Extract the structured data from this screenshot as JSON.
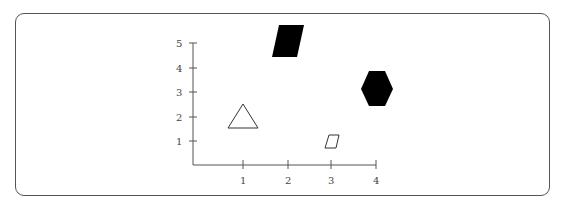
{
  "diagram": {
    "type": "coordinate-grid-with-shapes",
    "x_axis": {
      "ticks": [
        "1",
        "2",
        "3",
        "4"
      ]
    },
    "y_axis": {
      "ticks": [
        "1",
        "2",
        "3",
        "4",
        "5"
      ]
    },
    "shapes": [
      {
        "name": "triangle",
        "fill": "none",
        "stroke": "#333333",
        "approx_position": [
          1,
          2
        ]
      },
      {
        "name": "parallelogram-large",
        "fill": "#000000",
        "approx_position": [
          2,
          5
        ]
      },
      {
        "name": "parallelogram-small",
        "fill": "none",
        "stroke": "#333333",
        "approx_position": [
          3,
          1
        ]
      },
      {
        "name": "hexagon",
        "fill": "#000000",
        "approx_position": [
          4,
          3
        ]
      }
    ]
  }
}
